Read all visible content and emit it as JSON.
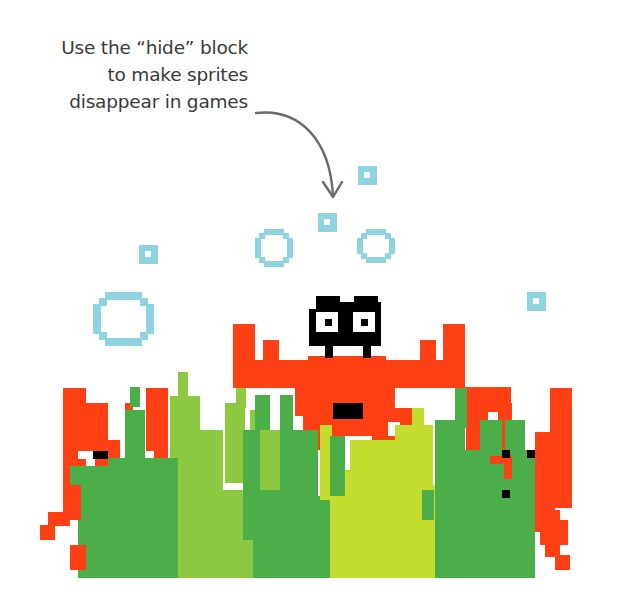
{
  "caption": {
    "lines": [
      "Use the “hide” block",
      "to make sprites",
      "disappear in games"
    ],
    "color": "#3a3a3a"
  },
  "arrow": {
    "color": "#6b6b6b",
    "path": "M 256 113 C 300 108, 330 140, 333 196",
    "head": "M 323 182 L 333 197 L 342 182"
  },
  "colors": {
    "bubble": "#8ed3e0",
    "red": "#ff4014",
    "black": "#000000",
    "dark_green": "#4cae49",
    "light_green": "#8cc840",
    "yellow_green": "#c3dd2f",
    "white": "#ffffff"
  },
  "sprites": {
    "bubbles": [
      {
        "name": "small-bubble-1",
        "type": "square",
        "x": 358,
        "y": 166,
        "size": 19
      },
      {
        "name": "small-bubble-2",
        "type": "square",
        "x": 318,
        "y": 213,
        "size": 19
      },
      {
        "name": "small-bubble-3",
        "type": "square",
        "x": 139,
        "y": 245,
        "size": 19
      },
      {
        "name": "small-bubble-4",
        "type": "square",
        "x": 527,
        "y": 292,
        "size": 19
      },
      {
        "name": "medium-bubble-1",
        "type": "ring",
        "x": 255,
        "y": 229,
        "w": 38,
        "h": 38
      },
      {
        "name": "medium-bubble-2",
        "type": "ring",
        "x": 357,
        "y": 229,
        "w": 38,
        "h": 34
      },
      {
        "name": "large-bubble",
        "type": "ring",
        "x": 93,
        "y": 292,
        "w": 61,
        "h": 54
      }
    ],
    "rects": [
      {
        "c": "red",
        "x": 233,
        "y": 324,
        "w": 22,
        "h": 64
      },
      {
        "c": "red",
        "x": 263,
        "y": 340,
        "w": 16,
        "h": 48
      },
      {
        "c": "red",
        "x": 233,
        "y": 360,
        "w": 232,
        "h": 28
      },
      {
        "c": "red",
        "x": 443,
        "y": 324,
        "w": 22,
        "h": 64
      },
      {
        "c": "red",
        "x": 420,
        "y": 340,
        "w": 16,
        "h": 48
      },
      {
        "c": "red",
        "x": 308,
        "y": 356,
        "w": 78,
        "h": 32
      },
      {
        "c": "red",
        "x": 295,
        "y": 388,
        "w": 100,
        "h": 28
      },
      {
        "c": "red",
        "x": 303,
        "y": 416,
        "w": 85,
        "h": 20
      },
      {
        "c": "red",
        "x": 385,
        "y": 408,
        "w": 32,
        "h": 14
      },
      {
        "c": "red",
        "x": 400,
        "y": 418,
        "w": 24,
        "h": 18
      },
      {
        "c": "red",
        "x": 310,
        "y": 436,
        "w": 30,
        "h": 14
      },
      {
        "c": "red",
        "x": 270,
        "y": 436,
        "w": 10,
        "h": 14
      },
      {
        "c": "red",
        "x": 372,
        "y": 436,
        "w": 25,
        "h": 12
      },
      {
        "c": "red",
        "x": 382,
        "y": 446,
        "w": 22,
        "h": 12
      },
      {
        "c": "red",
        "x": 390,
        "y": 456,
        "w": 14,
        "h": 8
      },
      {
        "c": "black",
        "x": 309,
        "y": 302,
        "w": 72,
        "h": 44
      },
      {
        "c": "black",
        "x": 316,
        "y": 296,
        "w": 24,
        "h": 8
      },
      {
        "c": "black",
        "x": 354,
        "y": 296,
        "w": 24,
        "h": 8
      },
      {
        "c": "white",
        "x": 316,
        "y": 312,
        "w": 22,
        "h": 20
      },
      {
        "c": "white",
        "x": 353,
        "y": 312,
        "w": 22,
        "h": 20
      },
      {
        "c": "black",
        "x": 325,
        "y": 319,
        "w": 7,
        "h": 7
      },
      {
        "c": "black",
        "x": 361,
        "y": 319,
        "w": 7,
        "h": 7
      },
      {
        "c": "white",
        "x": 309,
        "y": 302,
        "w": 7,
        "h": 7
      },
      {
        "c": "white",
        "x": 340,
        "y": 296,
        "w": 14,
        "h": 6
      },
      {
        "c": "black",
        "x": 325,
        "y": 340,
        "w": 8,
        "h": 18
      },
      {
        "c": "black",
        "x": 363,
        "y": 340,
        "w": 8,
        "h": 18
      },
      {
        "c": "white",
        "x": 333,
        "y": 346,
        "w": 30,
        "h": 10
      },
      {
        "c": "black",
        "x": 333,
        "y": 403,
        "w": 30,
        "h": 16
      },
      {
        "c": "red",
        "x": 63,
        "y": 388,
        "w": 23,
        "h": 100
      },
      {
        "c": "red",
        "x": 86,
        "y": 403,
        "w": 22,
        "h": 55
      },
      {
        "c": "red",
        "x": 95,
        "y": 440,
        "w": 25,
        "h": 40
      },
      {
        "c": "red",
        "x": 146,
        "y": 388,
        "w": 22,
        "h": 100
      },
      {
        "c": "red",
        "x": 125,
        "y": 403,
        "w": 8,
        "h": 8
      },
      {
        "c": "white",
        "x": 78,
        "y": 451,
        "w": 15,
        "h": 8
      },
      {
        "c": "black",
        "x": 93,
        "y": 451,
        "w": 15,
        "h": 8
      },
      {
        "c": "white",
        "x": 146,
        "y": 451,
        "w": 8,
        "h": 8
      },
      {
        "c": "black",
        "x": 101,
        "y": 490,
        "w": 8,
        "h": 24
      },
      {
        "c": "red",
        "x": 465,
        "y": 387,
        "w": 46,
        "h": 25
      },
      {
        "c": "red",
        "x": 466,
        "y": 388,
        "w": 22,
        "h": 70
      },
      {
        "c": "red",
        "x": 498,
        "y": 403,
        "w": 14,
        "h": 55
      },
      {
        "c": "red",
        "x": 550,
        "y": 388,
        "w": 22,
        "h": 120
      },
      {
        "c": "red",
        "x": 535,
        "y": 432,
        "w": 20,
        "h": 100
      },
      {
        "c": "light_green",
        "x": 178,
        "y": 372,
        "w": 10,
        "h": 206
      },
      {
        "c": "light_green",
        "x": 170,
        "y": 396,
        "w": 30,
        "h": 182
      },
      {
        "c": "light_green",
        "x": 178,
        "y": 430,
        "w": 45,
        "h": 148
      },
      {
        "c": "light_green",
        "x": 225,
        "y": 403,
        "w": 20,
        "h": 80
      },
      {
        "c": "light_green",
        "x": 236,
        "y": 388,
        "w": 10,
        "h": 20
      },
      {
        "c": "light_green",
        "x": 160,
        "y": 490,
        "w": 100,
        "h": 88
      },
      {
        "c": "dark_green",
        "x": 130,
        "y": 387,
        "w": 10,
        "h": 20
      },
      {
        "c": "dark_green",
        "x": 125,
        "y": 410,
        "w": 20,
        "h": 168
      },
      {
        "c": "dark_green",
        "x": 108,
        "y": 458,
        "w": 70,
        "h": 120
      },
      {
        "c": "dark_green",
        "x": 70,
        "y": 466,
        "w": 40,
        "h": 20
      },
      {
        "c": "dark_green",
        "x": 78,
        "y": 480,
        "w": 30,
        "h": 98
      },
      {
        "c": "dark_green",
        "x": 85,
        "y": 510,
        "w": 20,
        "h": 68
      },
      {
        "c": "dark_green",
        "x": 93,
        "y": 540,
        "w": 25,
        "h": 38
      },
      {
        "c": "red",
        "x": 63,
        "y": 485,
        "w": 18,
        "h": 35
      },
      {
        "c": "red",
        "x": 48,
        "y": 512,
        "w": 22,
        "h": 14
      },
      {
        "c": "red",
        "x": 40,
        "y": 525,
        "w": 15,
        "h": 15
      },
      {
        "c": "red",
        "x": 70,
        "y": 545,
        "w": 16,
        "h": 25
      },
      {
        "c": "light_green",
        "x": 250,
        "y": 410,
        "w": 10,
        "h": 20
      },
      {
        "c": "dark_green",
        "x": 243,
        "y": 430,
        "w": 75,
        "h": 148
      },
      {
        "c": "dark_green",
        "x": 255,
        "y": 395,
        "w": 15,
        "h": 40
      },
      {
        "c": "dark_green",
        "x": 280,
        "y": 395,
        "w": 13,
        "h": 60
      },
      {
        "c": "light_green",
        "x": 260,
        "y": 430,
        "w": 20,
        "h": 60
      },
      {
        "c": "light_green",
        "x": 228,
        "y": 540,
        "w": 25,
        "h": 38
      },
      {
        "c": "dark_green",
        "x": 318,
        "y": 496,
        "w": 12,
        "h": 82
      },
      {
        "c": "yellow_green",
        "x": 320,
        "y": 425,
        "w": 12,
        "h": 75
      },
      {
        "c": "yellow_green",
        "x": 330,
        "y": 470,
        "w": 90,
        "h": 108
      },
      {
        "c": "yellow_green",
        "x": 350,
        "y": 440,
        "w": 60,
        "h": 40
      },
      {
        "c": "yellow_green",
        "x": 395,
        "y": 425,
        "w": 38,
        "h": 60
      },
      {
        "c": "yellow_green",
        "x": 412,
        "y": 408,
        "w": 12,
        "h": 30
      },
      {
        "c": "yellow_green",
        "x": 415,
        "y": 485,
        "w": 20,
        "h": 93
      },
      {
        "c": "dark_green",
        "x": 330,
        "y": 436,
        "w": 15,
        "h": 60
      },
      {
        "c": "dark_green",
        "x": 422,
        "y": 490,
        "w": 12,
        "h": 30
      },
      {
        "c": "dark_green",
        "x": 435,
        "y": 420,
        "w": 30,
        "h": 158
      },
      {
        "c": "dark_green",
        "x": 455,
        "y": 388,
        "w": 12,
        "h": 40
      },
      {
        "c": "dark_green",
        "x": 465,
        "y": 450,
        "w": 70,
        "h": 128
      },
      {
        "c": "dark_green",
        "x": 480,
        "y": 420,
        "w": 22,
        "h": 40
      },
      {
        "c": "dark_green",
        "x": 505,
        "y": 420,
        "w": 20,
        "h": 35
      },
      {
        "c": "red",
        "x": 504,
        "y": 455,
        "w": 8,
        "h": 24
      },
      {
        "c": "red",
        "x": 490,
        "y": 456,
        "w": 20,
        "h": 8
      },
      {
        "c": "black",
        "x": 502,
        "y": 450,
        "w": 8,
        "h": 8
      },
      {
        "c": "black",
        "x": 527,
        "y": 450,
        "w": 8,
        "h": 8
      },
      {
        "c": "black",
        "x": 502,
        "y": 490,
        "w": 8,
        "h": 8
      },
      {
        "c": "red",
        "x": 535,
        "y": 510,
        "w": 25,
        "h": 15
      },
      {
        "c": "red",
        "x": 550,
        "y": 520,
        "w": 18,
        "h": 25
      },
      {
        "c": "red",
        "x": 540,
        "y": 530,
        "w": 12,
        "h": 15
      },
      {
        "c": "red",
        "x": 545,
        "y": 545,
        "w": 15,
        "h": 12
      },
      {
        "c": "red",
        "x": 555,
        "y": 555,
        "w": 15,
        "h": 15
      }
    ]
  }
}
